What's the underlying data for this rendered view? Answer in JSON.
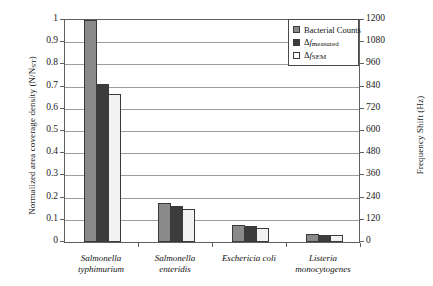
{
  "chart_data": {
    "type": "bar",
    "title": "",
    "categories": [
      "Salmonella\ntyphimurium",
      "Salmonella\nenteridis",
      "Eschericia coli",
      "Listeria\nmonocytogenes"
    ],
    "series": [
      {
        "name": "Bacterial Counts",
        "color": "#8a8a8a",
        "values": [
          1.0,
          0.175,
          0.075,
          0.035
        ]
      },
      {
        "name": "Δf_measured",
        "color": "#3c3c3c",
        "values": [
          0.71,
          0.16,
          0.07,
          0.03
        ]
      },
      {
        "name": "Δf_SEM",
        "color": "#f2f2f2",
        "values": [
          0.665,
          0.15,
          0.065,
          0.03
        ]
      }
    ],
    "xlabel": "",
    "ylabel": "Normalized area coverage density (N/NST)",
    "ylabel_right": "Frequency Shift (Hz)",
    "ylim": [
      0,
      1
    ],
    "ylim_right": [
      0,
      1200
    ],
    "yticks": [
      "1",
      "0.9",
      "0.8",
      "0.7",
      "0.6",
      "0.5",
      "0.4",
      "0.3",
      "0.2",
      "0.1",
      "0"
    ],
    "yticks_right": [
      "1200",
      "1080",
      "960",
      "840",
      "720",
      "600",
      "480",
      "360",
      "240",
      "120",
      "0"
    ],
    "grid": true,
    "legend_position": "top-right"
  },
  "axes": {
    "left_title_main": "Normalized area coverage density (N/N",
    "left_title_sub": "ST",
    "left_title_close": ")",
    "right_title": "Frequency Shift (Hz)"
  },
  "legend": {
    "items": [
      {
        "label": "Bacterial Counts",
        "swatch": "gray-swatch"
      },
      {
        "label_delta": "Δ",
        "label_f": "f",
        "label_sub": "measured",
        "swatch": "dark-swatch"
      },
      {
        "label_delta": "Δ",
        "label_f": "f",
        "label_sub": "SEM",
        "swatch": "white-swatch"
      }
    ]
  }
}
